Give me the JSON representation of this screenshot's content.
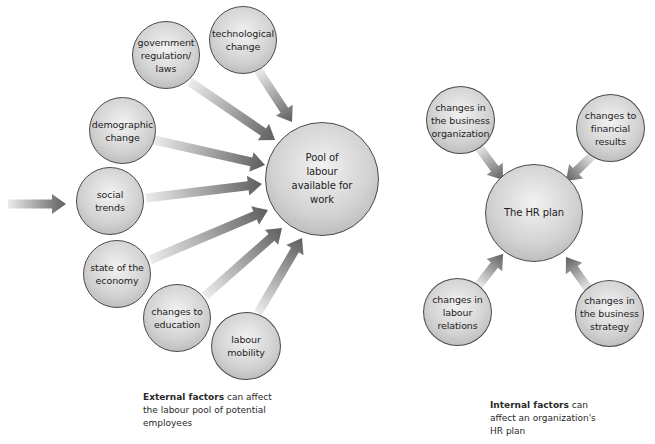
{
  "external": {
    "center": {
      "label": "Pool of\nlabour\navailable for\nwork"
    },
    "factors": [
      {
        "label": "technological\nchange"
      },
      {
        "label": "government\nregulation/\nlaws"
      },
      {
        "label": "demographic\nchange"
      },
      {
        "label": "social\ntrends"
      },
      {
        "label": "state of the\neconomy"
      },
      {
        "label": "changes to\neducation"
      },
      {
        "label": "labour\nmobility"
      }
    ],
    "caption": {
      "bold": "External factors",
      "text": " can affect the labour pool of potential employees"
    }
  },
  "internal": {
    "center": {
      "label": "The HR plan"
    },
    "factors": [
      {
        "label": "changes in\nthe business\norganization"
      },
      {
        "label": "changes to\nfinancial\nresults"
      },
      {
        "label": "changes in\nlabour\nrelations"
      },
      {
        "label": "changes in\nthe business\nstrategy"
      }
    ],
    "caption": {
      "bold": "Internal factors",
      "text": " can affect an organization's HR plan"
    }
  },
  "colors": {
    "arrow_dark": "#6a6a6a",
    "arrow_light": "#e4e4e4",
    "node_border": "#4a4a4a"
  }
}
